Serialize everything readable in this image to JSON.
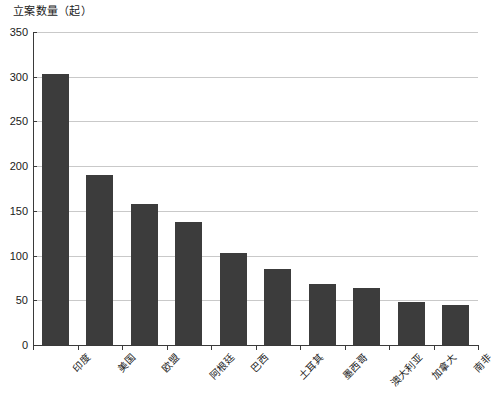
{
  "chart_data": {
    "type": "bar",
    "title": "立案数量（起）",
    "xlabel": "",
    "ylabel": "立案数量（起）",
    "categories": [
      "印度",
      "美国",
      "欧盟",
      "阿根廷",
      "巴西",
      "土耳其",
      "墨西哥",
      "澳大利亚",
      "加拿大",
      "南非"
    ],
    "values": [
      303,
      190,
      158,
      137,
      103,
      85,
      68,
      64,
      48,
      45
    ],
    "ylim": [
      0,
      350
    ],
    "ytick_labels": [
      "0",
      "50",
      "100",
      "150",
      "200",
      "250",
      "300",
      "350"
    ],
    "ytick_values": [
      0,
      50,
      100,
      150,
      200,
      250,
      300,
      350
    ],
    "grid": true,
    "legend": "none",
    "bar_color": "#3c3c3c",
    "grid_color": "#c9c9c9",
    "axis_color": "#3a3a3a",
    "background_color": "#ffffff"
  }
}
